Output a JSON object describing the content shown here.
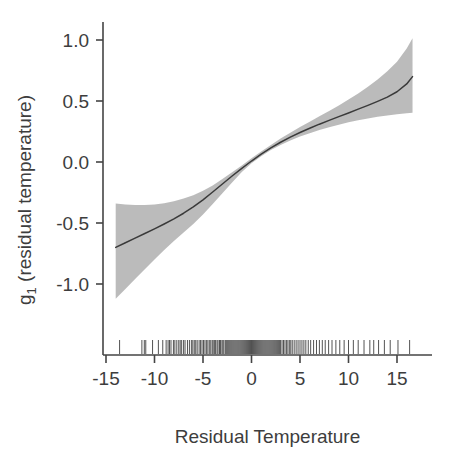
{
  "chart_data": {
    "type": "line",
    "title": "",
    "subtitle": "",
    "xlabel": "Residual Temperature",
    "ylabel": "g_1 (residual temperature)",
    "ylabel_base": "g",
    "ylabel_subscript": "1",
    "ylabel_rest": " (residual temperature)",
    "xlim": [
      -15.5,
      17.5
    ],
    "ylim": [
      -1.25,
      1.1
    ],
    "xticks": [
      -15,
      -10,
      -5,
      0,
      5,
      10,
      15
    ],
    "xticklabels": [
      "-15",
      "-10",
      "-5",
      "0",
      "5",
      "10",
      "15"
    ],
    "yticks": [
      1.0,
      0.5,
      0.0,
      -0.5,
      -1.0
    ],
    "yticklabels": [
      "1.0",
      "0.5",
      "0.0",
      "-0.5",
      "-1.0"
    ],
    "grid": false,
    "legend": "none",
    "series": [
      {
        "name": "g1 smooth fit",
        "kind": "line",
        "color": "#3a3a3a",
        "x": [
          -14.0,
          -13.0,
          -12.0,
          -11.0,
          -10.0,
          -9.0,
          -8.0,
          -7.0,
          -6.0,
          -5.0,
          -4.0,
          -3.0,
          -2.0,
          -1.0,
          0.0,
          1.0,
          2.0,
          3.0,
          4.0,
          5.0,
          6.0,
          7.0,
          8.0,
          9.0,
          10.0,
          11.0,
          12.0,
          13.0,
          14.0,
          15.0,
          16.0,
          16.6
        ],
        "y": [
          -0.7,
          -0.662,
          -0.624,
          -0.586,
          -0.548,
          -0.508,
          -0.466,
          -0.42,
          -0.368,
          -0.31,
          -0.246,
          -0.18,
          -0.115,
          -0.052,
          0.008,
          0.064,
          0.115,
          0.162,
          0.204,
          0.242,
          0.277,
          0.31,
          0.341,
          0.372,
          0.402,
          0.433,
          0.464,
          0.497,
          0.532,
          0.576,
          0.64,
          0.7
        ]
      },
      {
        "name": "confidence band upper",
        "kind": "band-upper",
        "color": "#a8a8a8",
        "x": [
          -14.0,
          -13.0,
          -12.0,
          -11.0,
          -10.0,
          -9.0,
          -8.0,
          -7.0,
          -6.0,
          -5.0,
          -4.0,
          -3.0,
          -2.0,
          -1.0,
          0.0,
          1.0,
          2.0,
          3.0,
          4.0,
          5.0,
          6.0,
          7.0,
          8.0,
          9.0,
          10.0,
          11.0,
          12.0,
          13.0,
          14.0,
          15.0,
          16.0,
          16.6
        ],
        "y": [
          -0.34,
          -0.348,
          -0.352,
          -0.352,
          -0.348,
          -0.338,
          -0.322,
          -0.3,
          -0.272,
          -0.236,
          -0.192,
          -0.14,
          -0.085,
          -0.028,
          0.03,
          0.086,
          0.14,
          0.192,
          0.24,
          0.286,
          0.33,
          0.374,
          0.418,
          0.464,
          0.512,
          0.562,
          0.616,
          0.676,
          0.744,
          0.822,
          0.93,
          1.015
        ]
      },
      {
        "name": "confidence band lower",
        "kind": "band-lower",
        "color": "#a8a8a8",
        "x": [
          -14.0,
          -13.0,
          -12.0,
          -11.0,
          -10.0,
          -9.0,
          -8.0,
          -7.0,
          -6.0,
          -5.0,
          -4.0,
          -3.0,
          -2.0,
          -1.0,
          0.0,
          1.0,
          2.0,
          3.0,
          4.0,
          5.0,
          6.0,
          7.0,
          8.0,
          9.0,
          10.0,
          11.0,
          12.0,
          13.0,
          14.0,
          15.0,
          16.0,
          16.6
        ],
        "y": [
          -1.12,
          -1.04,
          -0.96,
          -0.88,
          -0.8,
          -0.722,
          -0.648,
          -0.578,
          -0.508,
          -0.43,
          -0.344,
          -0.256,
          -0.168,
          -0.082,
          -0.01,
          0.048,
          0.098,
          0.14,
          0.176,
          0.208,
          0.236,
          0.262,
          0.285,
          0.306,
          0.325,
          0.342,
          0.357,
          0.37,
          0.382,
          0.392,
          0.4,
          0.404
        ]
      },
      {
        "name": "rug (observed residual temperatures)",
        "kind": "rug",
        "color": "#3f3f3f",
        "y_position": -1.16,
        "x": [
          -13.6,
          -11.3,
          -11.05,
          -10.9,
          -10.2,
          -9.6,
          -9.15,
          -8.8,
          -8.6,
          -8.45,
          -8.3,
          -8.05,
          -7.9,
          -7.7,
          -7.5,
          -7.35,
          -7.2,
          -7.0,
          -6.85,
          -6.6,
          -6.4,
          -6.2,
          -6.05,
          -5.9,
          -5.75,
          -5.6,
          -5.4,
          -5.25,
          -5.1,
          -4.95,
          -4.8,
          -4.65,
          -4.5,
          -4.35,
          -4.2,
          -4.05,
          -3.95,
          -3.8,
          -3.7,
          -3.55,
          -3.45,
          -3.3,
          -3.2,
          -3.05,
          -2.95,
          -2.85,
          -2.7,
          -2.6,
          -2.5,
          -2.4,
          -2.3,
          -2.2,
          -2.1,
          -2.0,
          -1.9,
          -1.8,
          -1.7,
          -1.6,
          -1.5,
          -1.4,
          -1.3,
          -1.2,
          -1.1,
          -1.0,
          -0.9,
          -0.8,
          -0.7,
          -0.6,
          -0.5,
          -0.4,
          -0.3,
          -0.2,
          -0.1,
          0.0,
          0.1,
          0.2,
          0.3,
          0.4,
          0.5,
          0.6,
          0.7,
          0.8,
          0.9,
          1.0,
          1.1,
          1.2,
          1.3,
          1.4,
          1.5,
          1.6,
          1.7,
          1.8,
          1.9,
          2.0,
          2.1,
          2.2,
          2.3,
          2.4,
          2.5,
          2.6,
          2.7,
          2.8,
          2.9,
          3.0,
          3.15,
          3.3,
          3.45,
          3.6,
          3.75,
          3.9,
          4.05,
          4.2,
          4.4,
          4.6,
          4.8,
          5.0,
          5.2,
          5.4,
          5.6,
          5.85,
          6.1,
          6.4,
          6.7,
          7.0,
          7.3,
          7.6,
          7.95,
          8.3,
          8.7,
          9.1,
          9.55,
          10.0,
          10.5,
          11.0,
          11.6,
          12.2,
          12.6,
          13.1,
          13.7,
          14.3,
          15.1,
          16.3
        ]
      }
    ],
    "annotations": []
  },
  "figure": {
    "background_color": "#ffffff",
    "axis_color": "#444444",
    "band_color": "#a8a8a8",
    "line_color": "#3a3a3a",
    "text_color": "#3d3d3d"
  }
}
